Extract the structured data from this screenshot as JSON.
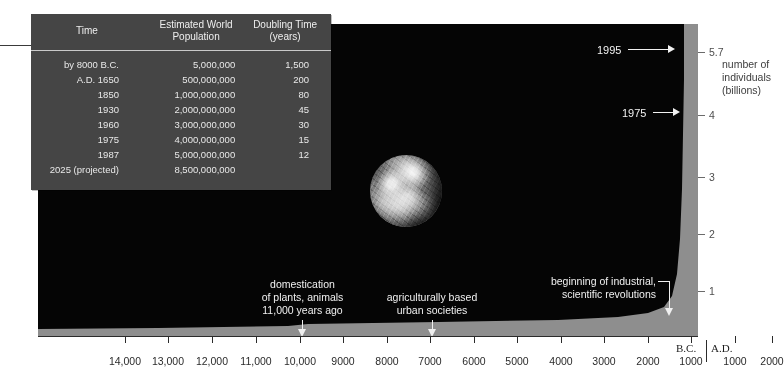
{
  "figure": {
    "earth_icon": "earth-photograph"
  },
  "table": {
    "headers": {
      "time": "Time",
      "population": "Estimated World\nPopulation",
      "population_line1": "Estimated World",
      "population_line2": "Population",
      "doubling_line1": "Doubling Time",
      "doubling_line2": "(years)"
    },
    "rows": [
      {
        "time": "by 8000 B.C.",
        "population": "5,000,000",
        "doubling": "1,500"
      },
      {
        "time": "A.D. 1650",
        "population": "500,000,000",
        "doubling": "200"
      },
      {
        "time": "1850",
        "population": "1,000,000,000",
        "doubling": "80"
      },
      {
        "time": "1930",
        "population": "2,000,000,000",
        "doubling": "45"
      },
      {
        "time": "1960",
        "population": "3,000,000,000",
        "doubling": "30"
      },
      {
        "time": "1975",
        "population": "4,000,000,000",
        "doubling": "15"
      },
      {
        "time": "1987",
        "population": "5,000,000,000",
        "doubling": "12"
      },
      {
        "time": "2025 (projected)",
        "population": "8,500,000,000",
        "doubling": ""
      }
    ]
  },
  "y_axis": {
    "title_line1": "number of",
    "title_line2": "individuals",
    "title_line3": "(billions)",
    "ticks": [
      {
        "label": "5.7",
        "value": 5.7,
        "top": 47
      },
      {
        "label": "4",
        "value": 4,
        "top": 110
      },
      {
        "label": "3",
        "value": 3,
        "top": 172
      },
      {
        "label": "2",
        "value": 2,
        "top": 229
      },
      {
        "label": "1",
        "value": 1,
        "top": 286
      }
    ]
  },
  "year_callouts": [
    {
      "label": "1995",
      "text_left": 597,
      "top": 45,
      "line_left": 628,
      "line_width": 40
    },
    {
      "label": "1975",
      "text_left": 622,
      "top": 108,
      "line_left": 653,
      "line_width": 20
    }
  ],
  "annotations": [
    {
      "line1": "domestication",
      "line2": "of plants, animals",
      "line3": "11,000 years ago",
      "text_left": 250,
      "text_top": 278,
      "stem_left": 301,
      "stem_top": 320,
      "stem_height": 14
    },
    {
      "line1": "agriculturally based",
      "line2": "urban societies",
      "line3": "",
      "text_left": 380,
      "text_top": 291,
      "stem_left": 426,
      "stem_top": 320,
      "stem_height": 14
    },
    {
      "line1": "beginning of industrial,",
      "line2": "scientific revolutions",
      "line3": "",
      "text_left": 541,
      "text_top": 275,
      "stem_left": 668,
      "stem_top": 287,
      "stem_height": 30
    }
  ],
  "x_axis": {
    "era_bc": "B.C.",
    "era_ad": "A.D.",
    "ticks": [
      {
        "label": "14,000",
        "x": 125
      },
      {
        "label": "13,000",
        "x": 168
      },
      {
        "label": "12,000",
        "x": 212
      },
      {
        "label": "11,000",
        "x": 256
      },
      {
        "label": "10,000",
        "x": 300
      },
      {
        "label": "9000",
        "x": 343
      },
      {
        "label": "8000",
        "x": 387
      },
      {
        "label": "7000",
        "x": 430
      },
      {
        "label": "6000",
        "x": 474
      },
      {
        "label": "5000",
        "x": 517
      },
      {
        "label": "4000",
        "x": 561
      },
      {
        "label": "3000",
        "x": 604
      },
      {
        "label": "2000",
        "x": 648
      },
      {
        "label": "1000",
        "x": 691
      },
      {
        "label": "1000",
        "x": 735
      },
      {
        "label": "2000",
        "x": 772
      }
    ]
  },
  "chart_data": {
    "type": "area",
    "xlabel": "Years (B.C. / A.D.)",
    "ylabel": "number of individuals (billions)",
    "ylim": [
      0,
      5.7
    ],
    "xlim": [
      -14000,
      2000
    ],
    "grid": false,
    "legend": null,
    "yticks": [
      1,
      2,
      3,
      4,
      5.7
    ],
    "xticks": [
      -14000,
      -13000,
      -12000,
      -11000,
      -10000,
      -9000,
      -8000,
      -7000,
      -6000,
      -5000,
      -4000,
      -3000,
      -2000,
      -1000,
      1000,
      2000
    ],
    "x": [
      -14000,
      -11000,
      -8000,
      -5000,
      -2000,
      -1000,
      1,
      1000,
      1650,
      1850,
      1930,
      1960,
      1975,
      1987,
      1995
    ],
    "y": [
      0.004,
      0.005,
      0.005,
      0.03,
      0.1,
      0.12,
      0.2,
      0.31,
      0.5,
      1.0,
      2.0,
      3.0,
      4.0,
      5.0,
      5.7
    ],
    "annotations": [
      {
        "x": -9000,
        "text": "domestication of plants, animals 11,000 years ago"
      },
      {
        "x": -5000,
        "text": "agriculturally based urban societies"
      },
      {
        "x": 1750,
        "text": "beginning of industrial, scientific revolutions"
      },
      {
        "x": 1975,
        "text": "1975 = 4 billion"
      },
      {
        "x": 1995,
        "text": "1995 = 5.7 billion"
      }
    ],
    "table": {
      "columns": [
        "Time",
        "Estimated World Population",
        "Doubling Time (years)"
      ],
      "rows": [
        [
          "by 8000 B.C.",
          5000000,
          1500
        ],
        [
          "A.D. 1650",
          500000000,
          200
        ],
        [
          "1850",
          1000000000,
          80
        ],
        [
          "1930",
          2000000000,
          45
        ],
        [
          "1960",
          3000000000,
          30
        ],
        [
          "1975",
          4000000000,
          15
        ],
        [
          "1987",
          5000000000,
          12
        ],
        [
          "2025 (projected)",
          8500000000,
          null
        ]
      ]
    }
  },
  "colors": {
    "plot_background": "#050505",
    "curve_fill": "#8e8e8e",
    "axis_strip": "#8e8e8e",
    "table_background": "#454545",
    "text_light": "#f0f0f0",
    "text_dark": "#2b2b2b"
  }
}
